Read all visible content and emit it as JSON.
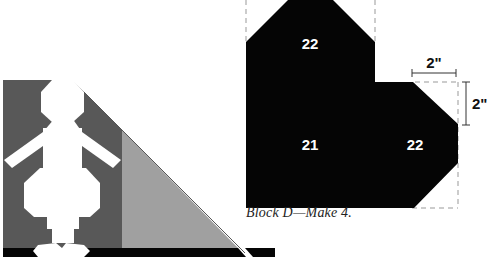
{
  "block_d": {
    "labels": {
      "top": "22",
      "bottom_left": "21",
      "bottom_right": "22"
    },
    "dimension_horizontal": "2\"",
    "dimension_vertical": "2\"",
    "caption": "Block D—Make 4."
  },
  "colors": {
    "dark_gray": "#585858",
    "light_gray": "#a0a0a0",
    "black": "#050505",
    "white": "#ffffff",
    "dashed_line": "#999999"
  },
  "left_illustration": {
    "description": "figure silhouette on dark gray with light gray triangle"
  }
}
